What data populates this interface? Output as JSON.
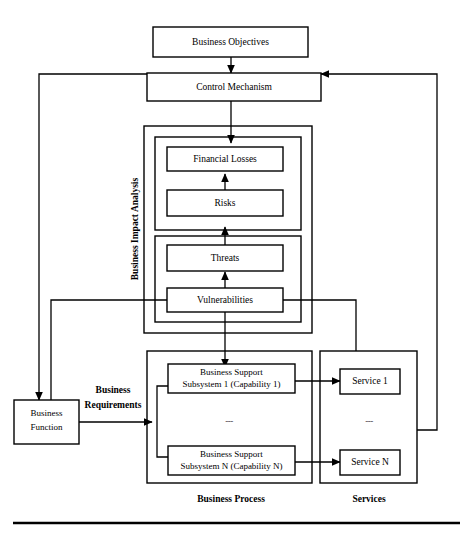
{
  "diagram": {
    "nodes": {
      "business_objectives": "Business Objectives",
      "control_mechanism": "Control Mechanism",
      "financial_losses": "Financial Losses",
      "risks": "Risks",
      "threats": "Threats",
      "vulnerabilities": "Vulnerabilities",
      "business_function": "Business Function",
      "subsystem_1_line1": "Business Support",
      "subsystem_1_line2": "Subsystem 1 (Capability 1)",
      "subsystem_n_line1": "Business Support",
      "subsystem_n_line2": "Subsystem N (Capability N)",
      "service_1": "Service 1",
      "service_n": "Service N"
    },
    "group_labels": {
      "business_impact_analysis": "Business Impact Analysis",
      "business_process": "Business Process",
      "services": "Services"
    },
    "edge_labels": {
      "business_requirements_line1": "Business",
      "business_requirements_line2": "Requirements"
    },
    "ellipsis": {
      "business_process": "---",
      "services": "---"
    },
    "colors": {
      "stroke": "#000000",
      "fill": "#ffffff",
      "background": "#ffffff"
    }
  }
}
